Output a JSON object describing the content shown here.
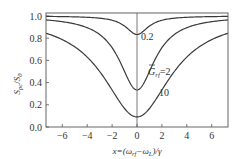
{
  "chart_data": {
    "type": "line",
    "title": "",
    "xlabel": "x=(ω_rf−ω_L)/γ",
    "ylabel": "S_pc/S_0",
    "xlim": [
      -7.3,
      7.3
    ],
    "ylim": [
      0.0,
      1.05
    ],
    "x_ticks": [
      -6,
      -4,
      -2,
      0,
      2,
      4,
      6
    ],
    "x_tick_labels": [
      "−6",
      "−4",
      "−2",
      "0",
      "2",
      "4",
      "6"
    ],
    "y_ticks": [
      0.0,
      0.2,
      0.4,
      0.6,
      0.8,
      1.0
    ],
    "y_tick_labels": [
      "0.0",
      "0.2",
      "0.4",
      "0.6",
      "0.8",
      "1.0"
    ],
    "grid": false,
    "vertical_line_at_x": 0,
    "series": [
      {
        "name": "0.2",
        "G": 0.2,
        "x": [
          -7,
          -6,
          -5,
          -4,
          -3,
          -2,
          -1,
          -0.5,
          0,
          0.5,
          1,
          2,
          3,
          4,
          5,
          6,
          7
        ],
        "values": [
          0.996,
          0.995,
          0.992,
          0.988,
          0.979,
          0.953,
          0.876,
          0.847,
          0.833,
          0.847,
          0.876,
          0.953,
          0.979,
          0.988,
          0.992,
          0.995,
          0.996
        ]
      },
      {
        "name": "G̃_rf=2",
        "G": 2,
        "x": [
          -7,
          -6,
          -5,
          -4,
          -3,
          -2,
          -1,
          -0.5,
          0,
          0.5,
          1,
          2,
          3,
          4,
          5,
          6,
          7
        ],
        "values": [
          0.962,
          0.952,
          0.933,
          0.896,
          0.833,
          0.733,
          0.5,
          0.385,
          0.333,
          0.385,
          0.5,
          0.733,
          0.833,
          0.896,
          0.933,
          0.952,
          0.962
        ]
      },
      {
        "name": "10",
        "G": 10,
        "x": [
          -7,
          -6,
          -5,
          -4,
          -3,
          -2,
          -1,
          -0.5,
          0,
          0.5,
          1,
          2,
          3,
          4,
          5,
          6,
          7
        ],
        "values": [
          0.833,
          0.788,
          0.722,
          0.625,
          0.485,
          0.303,
          0.167,
          0.111,
          0.091,
          0.111,
          0.167,
          0.303,
          0.485,
          0.625,
          0.722,
          0.788,
          0.833
        ]
      }
    ],
    "annotations": [
      {
        "text": "0.2",
        "near_x": 0.3,
        "near_y": 0.83
      },
      {
        "text": "G̃_rf=2",
        "near_x": 1.2,
        "near_y": 0.6
      },
      {
        "text": "10",
        "near_x": 2.2,
        "near_y": 0.36
      }
    ]
  },
  "labels": {
    "curve_a": "0.2",
    "curve_b_G": "G",
    "curve_b_sub": "rf",
    "curve_b_eq": "=2",
    "curve_c": "10",
    "ylabel_S": "S",
    "ylabel_sub_num": "pc",
    "ylabel_slash": "/",
    "ylabel_S0": "S",
    "ylabel_sub_den": "0",
    "xlabel_pre": "x=(ω",
    "xlabel_sub1": "rf",
    "xlabel_mid": "−ω",
    "xlabel_sub2": "L",
    "xlabel_post": ")/γ"
  },
  "colors": {
    "line": "#3a3a3a",
    "axis": "#555555",
    "text": "#333333"
  }
}
